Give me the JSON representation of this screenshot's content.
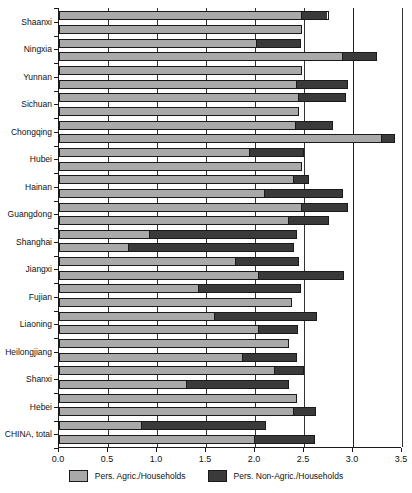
{
  "chart_data": {
    "type": "bar",
    "orientation": "horizontal",
    "stacked": true,
    "title": "",
    "xlabel": "",
    "ylabel": "",
    "xlim": [
      0.0,
      3.5
    ],
    "xticks": [
      0.0,
      0.5,
      1.0,
      1.5,
      2.0,
      2.5,
      3.0,
      3.5
    ],
    "xtick_labels": [
      "0.0",
      "0.5",
      "1.0",
      "1.5",
      "2.0",
      "2.5",
      "3.0",
      "3.5"
    ],
    "grid": true,
    "grid_axis": "x",
    "legend_position": "bottom",
    "legend": [
      "Pers. Agric./Households",
      "Pers. Non-Agric./Households"
    ],
    "colors": {
      "agric": "#a9a9a9",
      "nonagric": "#3a3a3a",
      "axis": "#1a1a1a",
      "grid": "#333333",
      "background": "#ffffff"
    },
    "categories": [
      "Shaanxi",
      "Ningxia",
      "Yunnan",
      "Sichuan",
      "Chongqing",
      "Hubei",
      "Hainan",
      "Guangdong",
      "Shanghai",
      "Jiangxi",
      "Fujian",
      "Liaoning",
      "Heilongjiang",
      "Shanxi",
      "Hebei",
      "CHINA, total"
    ],
    "series": [
      {
        "name": "Pers. Agric./Households",
        "key": "agric",
        "values": [
          2.48,
          2.9,
          2.93,
          3.3,
          2.48,
          2.48,
          2.48,
          2.48,
          2.44,
          2.35,
          2.23,
          2.14,
          2.43,
          2.36,
          2.43,
          2.0
        ]
      },
      {
        "name": "Pers. Non-Agric./Households",
        "key": "nonagric",
        "values": [
          0.27,
          0.34,
          0.0,
          0.13,
          0.33,
          0.3,
          0.2,
          0.0,
          0.18,
          0.0,
          0.0,
          0.0,
          0.1,
          0.0,
          0.22,
          0.61
        ]
      }
    ],
    "rows": [
      {
        "category": "Shaanxi",
        "sub": "a",
        "agric": 2.48,
        "nonagric": 0.27,
        "total": 2.75
      },
      {
        "category": "Shaanxi",
        "sub": "b",
        "agric": 2.48,
        "nonagric": 0.0,
        "total": 2.48
      },
      {
        "category": "Ningxia",
        "sub": "a",
        "agric": 2.02,
        "nonagric": 0.45,
        "total": 2.47
      },
      {
        "category": "Ningxia",
        "sub": "b",
        "agric": 2.9,
        "nonagric": 0.34,
        "total": 3.24
      },
      {
        "category": "Yunnan",
        "sub": "a",
        "agric": 2.48,
        "nonagric": 0.0,
        "total": 2.48
      },
      {
        "category": "Yunnan",
        "sub": "b",
        "agric": 2.42,
        "nonagric": 0.53,
        "total": 2.95
      },
      {
        "category": "Sichuan",
        "sub": "a",
        "agric": 2.45,
        "nonagric": 0.48,
        "total": 2.93
      },
      {
        "category": "Sichuan",
        "sub": "b",
        "agric": 2.45,
        "nonagric": 0.0,
        "total": 2.45
      },
      {
        "category": "Chongqing",
        "sub": "a",
        "agric": 2.42,
        "nonagric": 0.38,
        "total": 2.8
      },
      {
        "category": "Chongqing",
        "sub": "b",
        "agric": 3.3,
        "nonagric": 0.13,
        "total": 3.43
      },
      {
        "category": "Hubei",
        "sub": "a",
        "agric": 1.94,
        "nonagric": 0.56,
        "total": 2.5
      },
      {
        "category": "Hubei",
        "sub": "b",
        "agric": 2.48,
        "nonagric": 0.0,
        "total": 2.48
      },
      {
        "category": "Hainan",
        "sub": "a",
        "agric": 2.4,
        "nonagric": 0.15,
        "total": 2.55
      },
      {
        "category": "Hainan",
        "sub": "b",
        "agric": 2.1,
        "nonagric": 0.8,
        "total": 2.9
      },
      {
        "category": "Guangdong",
        "sub": "a",
        "agric": 2.48,
        "nonagric": 0.47,
        "total": 2.95
      },
      {
        "category": "Guangdong",
        "sub": "b",
        "agric": 2.34,
        "nonagric": 0.42,
        "total": 2.76
      },
      {
        "category": "Shanghai",
        "sub": "a",
        "agric": 0.92,
        "nonagric": 1.51,
        "total": 2.43
      },
      {
        "category": "Shanghai",
        "sub": "b",
        "agric": 0.7,
        "nonagric": 1.7,
        "total": 2.4
      },
      {
        "category": "Jiangxi",
        "sub": "a",
        "agric": 1.8,
        "nonagric": 0.65,
        "total": 2.45
      },
      {
        "category": "Jiangxi",
        "sub": "b",
        "agric": 2.03,
        "nonagric": 0.88,
        "total": 2.91
      },
      {
        "category": "Fujian",
        "sub": "a",
        "agric": 1.42,
        "nonagric": 1.05,
        "total": 2.47
      },
      {
        "category": "Fujian",
        "sub": "b",
        "agric": 2.38,
        "nonagric": 0.0,
        "total": 2.38
      },
      {
        "category": "Liaoning",
        "sub": "a",
        "agric": 1.58,
        "nonagric": 1.05,
        "total": 2.63
      },
      {
        "category": "Liaoning",
        "sub": "b",
        "agric": 2.04,
        "nonagric": 0.4,
        "total": 2.44
      },
      {
        "category": "Heilongjiang",
        "sub": "a",
        "agric": 2.35,
        "nonagric": 0.0,
        "total": 2.35
      },
      {
        "category": "Heilongjiang",
        "sub": "b",
        "agric": 1.87,
        "nonagric": 0.56,
        "total": 2.43
      },
      {
        "category": "Shanxi",
        "sub": "a",
        "agric": 2.2,
        "nonagric": 0.3,
        "total": 2.5
      },
      {
        "category": "Shanxi",
        "sub": "b",
        "agric": 1.3,
        "nonagric": 1.05,
        "total": 2.35
      },
      {
        "category": "Hebei",
        "sub": "a",
        "agric": 2.43,
        "nonagric": 0.0,
        "total": 2.43
      },
      {
        "category": "Hebei",
        "sub": "b",
        "agric": 2.4,
        "nonagric": 0.22,
        "total": 2.62
      },
      {
        "category": "CHINA, total",
        "sub": "a",
        "agric": 0.83,
        "nonagric": 1.28,
        "total": 2.11
      },
      {
        "category": "CHINA, total",
        "sub": "b",
        "agric": 2.0,
        "nonagric": 0.61,
        "total": 2.61
      }
    ]
  },
  "legend": {
    "agric_label": "Pers. Agric./Households",
    "nonagric_label": "Pers. Non-Agric./Households"
  }
}
